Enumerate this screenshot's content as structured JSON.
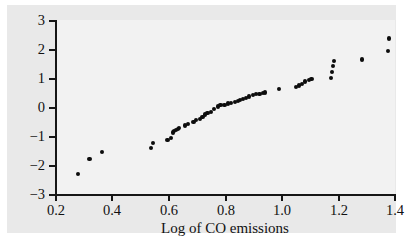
{
  "figure": {
    "background_color": "#e9e9e9",
    "plot_background_color": "#f2f2f2",
    "page_color": "#ffffff",
    "axis_color": "#161616",
    "marker_color": "#0d0d0d"
  },
  "chart_data": {
    "type": "scatter",
    "title": "",
    "subtitle": "",
    "xlabel": "Log of CO emissions",
    "ylabel": "",
    "xlim": [
      0.2,
      1.4
    ],
    "ylim": [
      -3,
      3
    ],
    "xticks": [
      "0.2",
      "0.4",
      "0.6",
      "0.8",
      "1.0",
      "1.2",
      "1.4"
    ],
    "xtick_values": [
      0.2,
      0.4,
      0.6,
      0.8,
      1.0,
      1.2,
      1.4
    ],
    "yticks": [
      "−3",
      "−2",
      "−1",
      "0",
      "1",
      "2",
      "3"
    ],
    "ytick_values": [
      -3,
      -2,
      -1,
      0,
      1,
      2,
      3
    ],
    "grid": false,
    "legend": null,
    "legend_position": "none",
    "marker": "filled-circle",
    "marker_size": 4,
    "n_points": 52,
    "x": [
      0.28,
      0.322,
      0.367,
      0.54,
      0.546,
      0.598,
      0.612,
      0.618,
      0.622,
      0.628,
      0.634,
      0.64,
      0.66,
      0.672,
      0.69,
      0.7,
      0.712,
      0.722,
      0.73,
      0.74,
      0.752,
      0.762,
      0.776,
      0.786,
      0.8,
      0.812,
      0.824,
      0.836,
      0.848,
      0.856,
      0.866,
      0.876,
      0.886,
      0.9,
      0.912,
      0.924,
      0.936,
      0.944,
      0.992,
      1.052,
      1.064,
      1.074,
      1.086,
      1.098,
      1.108,
      1.176,
      1.18,
      1.184,
      1.188,
      1.288,
      1.378,
      1.382
    ],
    "y": [
      -2.3,
      -1.78,
      -1.56,
      -1.4,
      -1.24,
      -1.14,
      -1.06,
      -0.88,
      -0.84,
      -0.8,
      -0.76,
      -0.72,
      -0.64,
      -0.6,
      -0.52,
      -0.46,
      -0.4,
      -0.34,
      -0.26,
      -0.22,
      -0.16,
      -0.08,
      0.02,
      0.06,
      0.08,
      0.12,
      0.14,
      0.18,
      0.22,
      0.24,
      0.28,
      0.32,
      0.36,
      0.42,
      0.44,
      0.46,
      0.48,
      0.5,
      0.62,
      0.68,
      0.74,
      0.8,
      0.88,
      0.92,
      0.96,
      1.0,
      1.2,
      1.4,
      1.6,
      1.64,
      1.92,
      2.36
    ]
  }
}
